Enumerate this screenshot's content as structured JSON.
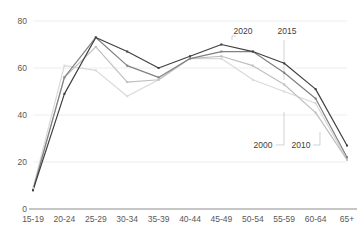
{
  "chart_data": {
    "type": "line",
    "title": "",
    "subtitle": "",
    "xlabel": "",
    "ylabel": "",
    "ylim": [
      0,
      80
    ],
    "yticks": [
      0,
      20,
      40,
      60,
      80
    ],
    "grid": true,
    "legend_position": "inline-callouts",
    "categories": [
      "15-19",
      "20-24",
      "25-29",
      "30-34",
      "35-39",
      "40-44",
      "45-49",
      "50-54",
      "55-59",
      "60-64",
      "65+"
    ],
    "series": [
      {
        "name": "2000",
        "color": "#d9d9d9",
        "values": [
          9,
          61,
          59,
          48,
          55,
          64,
          64,
          55,
          50,
          45,
          21
        ]
      },
      {
        "name": "2010",
        "color": "#bfbfbf",
        "values": [
          8,
          56,
          69,
          54,
          55,
          64,
          65,
          61,
          53,
          41,
          21
        ]
      },
      {
        "name": "2015",
        "color": "#808080",
        "values": [
          8,
          56,
          73,
          61,
          56,
          64,
          67,
          67,
          58,
          47,
          22
        ]
      },
      {
        "name": "2020",
        "color": "#404040",
        "values": [
          8,
          49,
          73,
          67,
          60,
          65,
          70,
          67,
          62,
          51,
          27
        ]
      }
    ],
    "annotations": [
      {
        "label": "2020",
        "x": 243,
        "y": 34
      },
      {
        "label": "2015",
        "x": 287,
        "y": 34
      },
      {
        "label": "2000",
        "x": 263,
        "y": 148
      },
      {
        "label": "2010",
        "x": 301,
        "y": 148
      }
    ]
  }
}
